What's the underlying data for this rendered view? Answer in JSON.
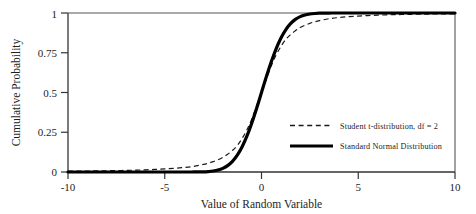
{
  "figure": {
    "background_color": "#ffffff",
    "frame_color": "#333333",
    "ink_color": "#1a1a1a"
  },
  "axes": {
    "x_title": "Value of Random Variable",
    "y_title": "Cumulative Probability",
    "x_ticks": [
      "-10",
      "-5",
      "0",
      "5",
      "10"
    ],
    "y_ticks": [
      "0",
      "0.25",
      "0.5",
      "0.75",
      "1"
    ]
  },
  "legend": {
    "items": [
      {
        "label": "Student t-distribution, df = 2",
        "style": "dashed",
        "color": "#1a1a1a"
      },
      {
        "label": "Standard Normal Distribution",
        "style": "solid",
        "color": "#000000"
      }
    ]
  },
  "chart_data": {
    "type": "line",
    "title": "",
    "subtitle": "",
    "xlabel": "Value of Random Variable",
    "ylabel": "Cumulative Probability",
    "xlim": [
      -10,
      10
    ],
    "ylim": [
      0,
      1
    ],
    "xticks": [
      -10,
      -5,
      0,
      5,
      10
    ],
    "yticks": [
      0,
      0.25,
      0.5,
      0.75,
      1
    ],
    "grid": false,
    "legend_position": "center-right",
    "series": [
      {
        "name": "Student t-distribution, df = 2",
        "style": "dashed",
        "color": "#1a1a1a",
        "linewidth": 1.2,
        "x": [
          -10,
          -9.5,
          -9,
          -8.5,
          -8,
          -7.5,
          -7,
          -6.5,
          -6,
          -5.5,
          -5,
          -4.5,
          -4,
          -3.5,
          -3,
          -2.75,
          -2.5,
          -2.25,
          -2,
          -1.75,
          -1.5,
          -1.25,
          -1,
          -0.75,
          -0.5,
          -0.25,
          0,
          0.25,
          0.5,
          0.75,
          1,
          1.25,
          1.5,
          1.75,
          2,
          2.25,
          2.5,
          2.75,
          3,
          3.5,
          4,
          4.5,
          5,
          5.5,
          6,
          6.5,
          7,
          7.5,
          8,
          8.5,
          9,
          9.5,
          10
        ],
        "y": [
          0.005,
          0.0055,
          0.0061,
          0.0069,
          0.0077,
          0.0088,
          0.0101,
          0.0117,
          0.0137,
          0.0163,
          0.0194,
          0.0234,
          0.0286,
          0.0357,
          0.0477,
          0.0553,
          0.0651,
          0.0766,
          0.0918,
          0.1113,
          0.1361,
          0.1667,
          0.2113,
          0.2662,
          0.3333,
          0.4167,
          0.5,
          0.5833,
          0.6667,
          0.7338,
          0.7887,
          0.8333,
          0.8639,
          0.8887,
          0.9082,
          0.9234,
          0.9349,
          0.9447,
          0.9523,
          0.9643,
          0.9714,
          0.9766,
          0.9806,
          0.9837,
          0.9863,
          0.9883,
          0.9899,
          0.9912,
          0.9923,
          0.9931,
          0.9939,
          0.9945,
          0.995
        ]
      },
      {
        "name": "Standard Normal Distribution",
        "style": "solid",
        "color": "#000000",
        "linewidth": 3.2,
        "x": [
          -10,
          -6,
          -4,
          -3.5,
          -3,
          -2.75,
          -2.5,
          -2.25,
          -2,
          -1.75,
          -1.5,
          -1.25,
          -1,
          -0.75,
          -0.5,
          -0.25,
          0,
          0.25,
          0.5,
          0.75,
          1,
          1.25,
          1.5,
          1.75,
          2,
          2.25,
          2.5,
          2.75,
          3,
          3.5,
          4,
          6,
          10
        ],
        "y": [
          0.0,
          0.0,
          3.17e-05,
          0.000233,
          0.00135,
          0.00298,
          0.00621,
          0.01222,
          0.02275,
          0.04006,
          0.06681,
          0.10565,
          0.15866,
          0.22663,
          0.30854,
          0.40129,
          0.5,
          0.59871,
          0.69146,
          0.77337,
          0.84134,
          0.89435,
          0.93319,
          0.95994,
          0.97725,
          0.98778,
          0.99379,
          0.99702,
          0.99865,
          0.99977,
          0.99997,
          1.0,
          1.0
        ]
      }
    ]
  }
}
